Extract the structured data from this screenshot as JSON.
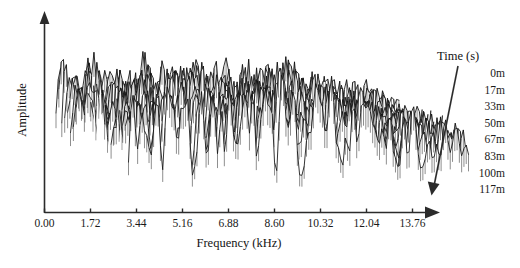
{
  "chart_data": {
    "type": "line",
    "subtype": "waterfall-3d-spectra",
    "title": "",
    "xlabel": "Frequency (kHz)",
    "ylabel": "Amplitude",
    "grid": false,
    "legend_position": "right",
    "legend_title": "Time (s)",
    "x_tick_labels": [
      "0.00",
      "1.72",
      "3.44",
      "5.16",
      "6.88",
      "8.60",
      "10.32",
      "12.04",
      "13.76"
    ],
    "x_tick_values": [
      0.0,
      1.72,
      3.44,
      5.16,
      6.88,
      8.6,
      10.32,
      12.04,
      13.76
    ],
    "xlim": [
      0.0,
      13.76
    ],
    "y_tick_labels": [],
    "ylim": [
      0,
      1
    ],
    "y_axis_style": "arrow-unlabeled",
    "x_axis_style": "arrow",
    "series": [
      {
        "name": "0m",
        "time_label": "0m"
      },
      {
        "name": "17m",
        "time_label": "17m"
      },
      {
        "name": "33m",
        "time_label": "33m"
      },
      {
        "name": "50m",
        "time_label": "50m"
      },
      {
        "name": "67m",
        "time_label": "67m"
      },
      {
        "name": "83m",
        "time_label": "83m"
      },
      {
        "name": "100m",
        "time_label": "100m"
      },
      {
        "name": "117m",
        "time_label": "117m"
      }
    ]
  },
  "axes": {
    "x_title": "Frequency (kHz)",
    "y_title": "Amplitude",
    "x_ticks": [
      {
        "label": "0.00"
      },
      {
        "label": "1.72"
      },
      {
        "label": "3.44"
      },
      {
        "label": "5.16"
      },
      {
        "label": "6.88"
      },
      {
        "label": "8.60"
      },
      {
        "label": "10.32"
      },
      {
        "label": "12.04"
      },
      {
        "label": "13.76"
      }
    ]
  },
  "legend": {
    "title": "Time (s)",
    "entries": [
      {
        "label": "0m"
      },
      {
        "label": "17m"
      },
      {
        "label": "33m"
      },
      {
        "label": "50m"
      },
      {
        "label": "67m"
      },
      {
        "label": "83m"
      },
      {
        "label": "100m"
      },
      {
        "label": "117m"
      }
    ]
  },
  "colors": {
    "ink": "#111111",
    "axis": "#2b2b2b",
    "background": "#ffffff"
  }
}
